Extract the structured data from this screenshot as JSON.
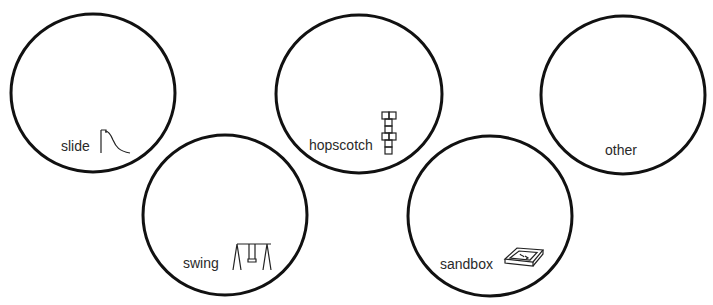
{
  "diagram": {
    "type": "sorting-circles",
    "stroke_color": "#111111",
    "label_color": "#2a2a2a",
    "background": "#ffffff",
    "circles": [
      {
        "id": "slide",
        "label": "slide",
        "icon": "slide-icon",
        "cx": 93,
        "cy": 93,
        "rx": 82,
        "ry": 79
      },
      {
        "id": "hopscotch",
        "label": "hopscotch",
        "icon": "hopscotch-icon",
        "cx": 359,
        "cy": 94,
        "rx": 83,
        "ry": 79
      },
      {
        "id": "other",
        "label": "other",
        "icon": null,
        "cx": 623,
        "cy": 95,
        "rx": 82,
        "ry": 79
      },
      {
        "id": "swing",
        "label": "swing",
        "icon": "swing-icon",
        "cx": 225,
        "cy": 215,
        "rx": 82,
        "ry": 80
      },
      {
        "id": "sandbox",
        "label": "sandbox",
        "icon": "sandbox-icon",
        "cx": 490,
        "cy": 216,
        "rx": 82,
        "ry": 80
      }
    ]
  }
}
